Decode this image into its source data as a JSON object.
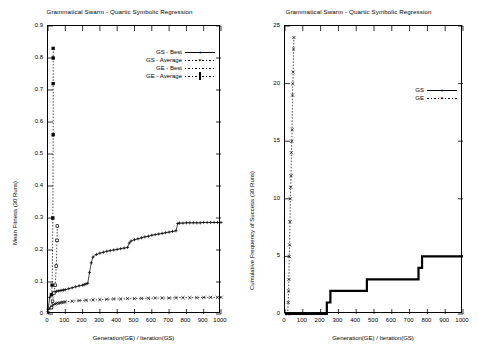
{
  "chart_data": [
    {
      "id": "left",
      "type": "line",
      "title": "Grammatical Swarm - Quartic Symbolic Regression",
      "xlabel": "Generation(GE) / Iteration(GS)",
      "ylabel": "Mean Fitness (30 Runs)",
      "xlim": [
        0,
        1000
      ],
      "ylim": [
        0,
        0.9
      ],
      "xticks": [
        0,
        100,
        200,
        300,
        400,
        500,
        600,
        700,
        800,
        900,
        1000
      ],
      "xticklabels": [
        "0",
        "100",
        "200",
        "300",
        "400",
        "500",
        "600",
        "700",
        "800",
        "900",
        "1000"
      ],
      "yticks": [
        0,
        0.1,
        0.2,
        0.3,
        0.4,
        0.5,
        0.6,
        0.7,
        0.8,
        0.9
      ],
      "yticklabels": [
        "0",
        "0.1",
        "0.2",
        "0.3",
        "0.4",
        "0.5",
        "0.6",
        "0.7",
        "0.8",
        "0.9"
      ],
      "grid": false,
      "legend_position": "top-right",
      "series": [
        {
          "name": "GS - Best",
          "marker": "plus",
          "line": "solid",
          "x": [
            0,
            10,
            20,
            30,
            40,
            50,
            60,
            70,
            80,
            90,
            100,
            120,
            140,
            160,
            180,
            200,
            210,
            220,
            230,
            240,
            250,
            260,
            280,
            300,
            320,
            340,
            360,
            380,
            400,
            420,
            440,
            460,
            470,
            480,
            500,
            520,
            540,
            560,
            580,
            600,
            620,
            640,
            660,
            680,
            700,
            720,
            740,
            750,
            760,
            780,
            800,
            820,
            840,
            860,
            880,
            900,
            920,
            940,
            960,
            980,
            1000
          ],
          "y": [
            0.015,
            0.052,
            0.062,
            0.066,
            0.069,
            0.071,
            0.072,
            0.073,
            0.074,
            0.075,
            0.076,
            0.079,
            0.082,
            0.085,
            0.088,
            0.09,
            0.092,
            0.094,
            0.096,
            0.13,
            0.16,
            0.178,
            0.186,
            0.19,
            0.193,
            0.196,
            0.198,
            0.2,
            0.202,
            0.204,
            0.206,
            0.208,
            0.222,
            0.228,
            0.232,
            0.235,
            0.238,
            0.241,
            0.243,
            0.246,
            0.248,
            0.25,
            0.252,
            0.254,
            0.256,
            0.258,
            0.26,
            0.283,
            0.284,
            0.284,
            0.285,
            0.285,
            0.285,
            0.285,
            0.285,
            0.286,
            0.286,
            0.286,
            0.286,
            0.286,
            0.286
          ]
        },
        {
          "name": "GS - Average",
          "marker": "cross",
          "line": "dotted",
          "x": [
            0,
            10,
            20,
            30,
            40,
            50,
            60,
            70,
            80,
            90,
            100,
            140,
            180,
            220,
            260,
            300,
            340,
            380,
            420,
            460,
            500,
            540,
            580,
            620,
            660,
            700,
            740,
            780,
            820,
            860,
            900,
            940,
            980,
            1000
          ],
          "y": [
            0.004,
            0.018,
            0.025,
            0.029,
            0.031,
            0.033,
            0.034,
            0.035,
            0.036,
            0.037,
            0.038,
            0.04,
            0.042,
            0.043,
            0.044,
            0.045,
            0.046,
            0.047,
            0.047,
            0.048,
            0.048,
            0.049,
            0.049,
            0.05,
            0.05,
            0.05,
            0.051,
            0.051,
            0.051,
            0.051,
            0.052,
            0.052,
            0.052,
            0.052
          ]
        },
        {
          "name": "GE - Best",
          "marker": "square-filled",
          "line": "dotted",
          "x": [
            20,
            24,
            28,
            30,
            30,
            30,
            30
          ],
          "y": [
            0.06,
            0.09,
            0.3,
            0.56,
            0.72,
            0.8,
            0.83
          ]
        },
        {
          "name": "GE - Average",
          "marker": "square-open",
          "line": "dotted",
          "x": [
            20,
            26,
            34,
            42,
            48,
            52,
            54
          ],
          "y": [
            0.02,
            0.04,
            0.065,
            0.09,
            0.15,
            0.23,
            0.275
          ]
        }
      ]
    },
    {
      "id": "right",
      "type": "line",
      "title": "Grammatical Swarm - Quartic Symbolic Regression",
      "xlabel": "Generation(GE) / Iteration(GS)",
      "ylabel": "Cumulative Frequency of Success (30 Runs)",
      "xlim": [
        0,
        1000
      ],
      "ylim": [
        0,
        25
      ],
      "xticks": [
        0,
        100,
        200,
        300,
        400,
        500,
        600,
        700,
        800,
        900,
        1000
      ],
      "xticklabels": [
        "0",
        "100",
        "200",
        "300",
        "400",
        "500",
        "600",
        "700",
        "800",
        "900",
        "1000"
      ],
      "yticks": [
        0,
        5,
        10,
        15,
        20,
        25
      ],
      "yticklabels": [
        "0",
        "5",
        "10",
        "15",
        "20",
        "25"
      ],
      "grid": false,
      "legend_position": "right-middle",
      "series": [
        {
          "name": "GS",
          "marker": "plus",
          "line": "solid",
          "x": [
            0,
            230,
            235,
            240,
            245,
            250,
            255,
            260,
            265,
            455,
            460,
            465,
            745,
            750,
            755,
            760,
            765,
            770,
            775,
            1000
          ],
          "y": [
            0,
            0,
            1,
            1,
            1,
            1,
            2,
            2,
            2,
            2,
            3,
            3,
            3,
            4,
            4,
            4,
            4,
            5,
            5,
            5
          ]
        },
        {
          "name": "GE",
          "marker": "cross",
          "line": "dotted",
          "x": [
            15,
            18,
            20,
            22,
            24,
            26,
            28,
            30,
            32,
            34,
            36,
            38,
            40,
            42,
            44,
            46,
            48,
            50
          ],
          "y": [
            0,
            1,
            2,
            3,
            5,
            6,
            8,
            10,
            11,
            12,
            14,
            15,
            16,
            19,
            20,
            21,
            23,
            24
          ]
        }
      ]
    }
  ]
}
